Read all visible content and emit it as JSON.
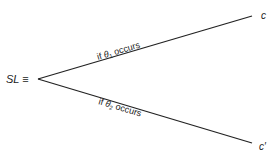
{
  "diagram": {
    "origin_label": "SL ≡",
    "branches": [
      {
        "condition_prefix": "if ",
        "condition_symbol": "θ",
        "condition_subscript": "1",
        "condition_suffix": " occurs",
        "outcome": "c"
      },
      {
        "condition_prefix": "if ",
        "condition_symbol": "θ",
        "condition_subscript": "2",
        "condition_suffix": " occurs",
        "outcome": "c′"
      }
    ],
    "colors": {
      "line": "#222222",
      "text": "#222222"
    }
  }
}
